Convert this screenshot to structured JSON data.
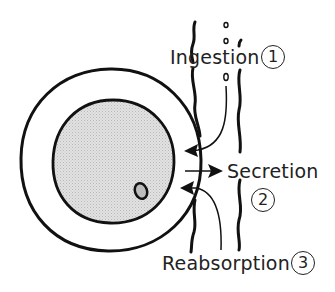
{
  "diagram": {
    "type": "cell-transport-illustration",
    "labels": {
      "ingestion": "Ingestion",
      "secretion": "Secretion",
      "reabsorption": "Reabsorption"
    },
    "numbers": {
      "ingestion": "1",
      "secretion": "2",
      "reabsorption": "3"
    },
    "colors": {
      "ink": "#111111",
      "nucleus_fill": "#d9d9d9",
      "background": "#ffffff"
    }
  }
}
